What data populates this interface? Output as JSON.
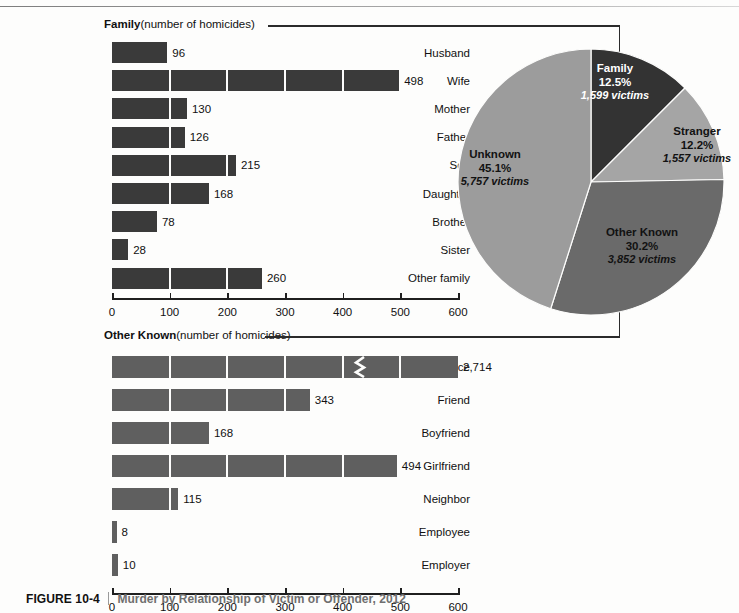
{
  "figure": {
    "number": "FIGURE 10-4",
    "caption": "Murder by Relationship of Victim or Offender, 2012"
  },
  "sections": {
    "family": {
      "title": "Family",
      "units": "(number of homicides)"
    },
    "other_known": {
      "title": "Other Known",
      "units": "(number of homicides)"
    }
  },
  "colors": {
    "family_bar": "#3a3a3a",
    "other_known_bar": "#5f5f5f",
    "pie_family": "#333333",
    "pie_stranger": "#a5a5a5",
    "pie_other_known": "#6a6a6a",
    "pie_unknown": "#9c9c9c",
    "axis": "#1f1f1f",
    "page_background": "#fdfdfc"
  },
  "chart_data": [
    {
      "type": "bar",
      "orientation": "horizontal",
      "title": "Family",
      "subtitle": "(number of homicides)",
      "xlabel": "number of homicides",
      "ylabel": "",
      "xlim": [
        0,
        600
      ],
      "xticks": [
        0,
        100,
        200,
        300,
        400,
        500,
        600
      ],
      "xticklabels": [
        "0",
        "100",
        "200",
        "300",
        "400",
        "500",
        "600"
      ],
      "grid": false,
      "segment_interval": 100,
      "categories": [
        "Husband",
        "Wife",
        "Mother",
        "Father",
        "Son",
        "Daughter",
        "Brother",
        "Sister",
        "Other family"
      ],
      "values": [
        96,
        498,
        130,
        126,
        215,
        168,
        78,
        28,
        260
      ],
      "value_labels": [
        "96",
        "498",
        "130",
        "126",
        "215",
        "168",
        "78",
        "28",
        "260"
      ]
    },
    {
      "type": "bar",
      "orientation": "horizontal",
      "title": "Other Known",
      "subtitle": "(number of homicides)",
      "xlabel": "number of homicides",
      "ylabel": "",
      "xlim": [
        0,
        600
      ],
      "xticks": [
        0,
        100,
        200,
        300,
        400,
        500,
        600
      ],
      "xticklabels": [
        "0",
        "100",
        "200",
        "300",
        "400",
        "500",
        "600"
      ],
      "grid": false,
      "segment_interval": 100,
      "categories": [
        "Acquaintance",
        "Friend",
        "Boyfriend",
        "Girlfriend",
        "Neighbor",
        "Employee",
        "Employer"
      ],
      "values": [
        2714,
        343,
        168,
        494,
        115,
        8,
        10
      ],
      "value_labels": [
        "2,714",
        "343",
        "168",
        "494",
        "115",
        "8",
        "10"
      ],
      "axis_break": {
        "category": "Acquaintance",
        "note": "bar truncated with zigzag break; actual value 2,714 exceeds axis maximum"
      }
    },
    {
      "type": "pie",
      "title": "",
      "legend_position": "inside-slices",
      "slices": [
        {
          "name": "Family",
          "percent": 12.5,
          "percent_label": "12.5%",
          "victims": 1599,
          "victims_label": "1,599 victims",
          "color": "#333333",
          "label_color": "#ffffff"
        },
        {
          "name": "Stranger",
          "percent": 12.2,
          "percent_label": "12.2%",
          "victims": 1557,
          "victims_label": "1,557 victims",
          "color": "#a5a5a5",
          "label_color": "#121212"
        },
        {
          "name": "Other Known",
          "percent": 30.2,
          "percent_label": "30.2%",
          "victims": 3852,
          "victims_label": "3,852 victims",
          "color": "#6a6a6a",
          "label_color": "#121212"
        },
        {
          "name": "Unknown",
          "percent": 45.1,
          "percent_label": "45.1%",
          "victims": 5757,
          "victims_label": "5,757 victims",
          "color": "#9c9c9c",
          "label_color": "#121212"
        }
      ]
    }
  ]
}
